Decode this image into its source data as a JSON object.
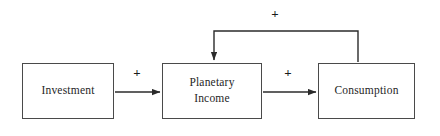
{
  "diagram": {
    "type": "causal-loop-diagram",
    "background_color": "#ffffff",
    "line_color": "#3f3f3f",
    "text_color": "#262626",
    "nodes": [
      {
        "id": "investment",
        "label": "Investment",
        "x": 22,
        "y": 63,
        "width": 92,
        "height": 56
      },
      {
        "id": "planetary-income",
        "label": "Planetary\nIncome",
        "x": 162,
        "y": 63,
        "width": 100,
        "height": 56
      },
      {
        "id": "consumption",
        "label": "Consumption",
        "x": 318,
        "y": 63,
        "width": 97,
        "height": 56
      }
    ],
    "links": [
      {
        "id": "investment-to-income",
        "from": "investment",
        "to": "planetary-income",
        "sign": "+",
        "sign_x": 136,
        "sign_y": 66
      },
      {
        "id": "income-to-consumption",
        "from": "planetary-income",
        "to": "consumption",
        "sign": "+",
        "sign_x": 287,
        "sign_y": 66
      },
      {
        "id": "consumption-to-income-feedback",
        "from": "consumption",
        "to": "planetary-income",
        "sign": "+",
        "sign_x": 274,
        "sign_y": 7
      }
    ]
  }
}
